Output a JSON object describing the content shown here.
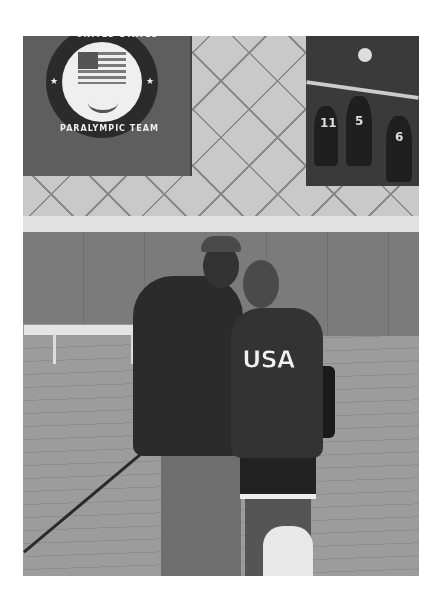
{
  "image": {
    "type": "photograph",
    "description": "Grayscale photo of a man in a cap and hoodie and a young woman in a USA hoodie posing together in a gymnasium",
    "tone": "grayscale"
  },
  "banner": {
    "emblem_top_text": "UNITED STATES",
    "emblem_bottom_text": "PARALYMPIC TEAM",
    "star_glyph": "★",
    "icons": [
      "us-flag-icon",
      "paralympic-agitos-icon"
    ]
  },
  "poster": {
    "subject": "sitting volleyball players at the net",
    "jersey_numbers": [
      "11",
      "5",
      "6"
    ]
  },
  "people": {
    "left": {
      "clothing": "cap and dark hoodie, gray pants"
    },
    "right": {
      "clothing": "USA hoodie, shorts, backpack, plastic bag",
      "hoodie_text": "USA"
    }
  },
  "colors": {
    "photo_border": "#ffffff",
    "wall_light": "#c9c9c9",
    "wall_pad": "#7b7b7b",
    "floor": "#9c9c9c"
  }
}
